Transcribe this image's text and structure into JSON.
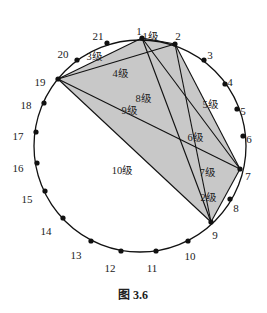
{
  "figure": {
    "caption": "图 3.6",
    "circle": {
      "cx": 140,
      "cy": 146,
      "r": 106
    },
    "shade_color": "#c8c8c8",
    "line_color": "#111111",
    "points": [
      {
        "id": "1",
        "x": 142,
        "y": 38,
        "lx": 139,
        "ly": 32
      },
      {
        "id": "2",
        "x": 175,
        "y": 44,
        "lx": 178,
        "ly": 37
      },
      {
        "id": "3",
        "x": 204,
        "y": 60,
        "lx": 210,
        "ly": 56
      },
      {
        "id": "4",
        "x": 225,
        "y": 84,
        "lx": 230,
        "ly": 83
      },
      {
        "id": "5",
        "x": 237,
        "y": 109,
        "lx": 243,
        "ly": 112
      },
      {
        "id": "6",
        "x": 243,
        "y": 136,
        "lx": 249,
        "ly": 140
      },
      {
        "id": "7",
        "x": 240,
        "y": 169,
        "lx": 248,
        "ly": 177
      },
      {
        "id": "8",
        "x": 230,
        "y": 199,
        "lx": 236,
        "ly": 209
      },
      {
        "id": "9",
        "x": 211,
        "y": 222,
        "lx": 215,
        "ly": 236
      },
      {
        "id": "10",
        "x": 188,
        "y": 241,
        "lx": 190,
        "ly": 257
      },
      {
        "id": "11",
        "x": 156,
        "y": 251,
        "lx": 152,
        "ly": 269
      },
      {
        "id": "12",
        "x": 121,
        "y": 251,
        "lx": 110,
        "ly": 269
      },
      {
        "id": "13",
        "x": 91,
        "y": 241,
        "lx": 76,
        "ly": 256
      },
      {
        "id": "14",
        "x": 63,
        "y": 218,
        "lx": 46,
        "ly": 232
      },
      {
        "id": "15",
        "x": 45,
        "y": 191,
        "lx": 27,
        "ly": 200
      },
      {
        "id": "16",
        "x": 37,
        "y": 163,
        "lx": 18,
        "ly": 169
      },
      {
        "id": "17",
        "x": 36,
        "y": 132,
        "lx": 18,
        "ly": 137
      },
      {
        "id": "18",
        "x": 44,
        "y": 103,
        "lx": 26,
        "ly": 106
      },
      {
        "id": "19",
        "x": 58,
        "y": 79,
        "lx": 40,
        "ly": 83
      },
      {
        "id": "20",
        "x": 77,
        "y": 60,
        "lx": 63,
        "ly": 55
      },
      {
        "id": "21",
        "x": 107,
        "y": 43,
        "lx": 98,
        "ly": 37
      }
    ],
    "edges": [
      [
        "19",
        "1"
      ],
      [
        "19",
        "2"
      ],
      [
        "19",
        "7"
      ],
      [
        "19",
        "9"
      ],
      [
        "1",
        "2"
      ],
      [
        "1",
        "7"
      ],
      [
        "1",
        "9"
      ],
      [
        "2",
        "7"
      ],
      [
        "2",
        "9"
      ],
      [
        "7",
        "9"
      ]
    ],
    "shaded_polygon": [
      "19",
      "1",
      "2",
      "7",
      "9"
    ],
    "level_labels": [
      {
        "text": "1级",
        "x": 150,
        "y": 38
      },
      {
        "text": "2级",
        "x": 208,
        "y": 199
      },
      {
        "text": "3级",
        "x": 94,
        "y": 58
      },
      {
        "text": "4级",
        "x": 120,
        "y": 75
      },
      {
        "text": "5级",
        "x": 210,
        "y": 106
      },
      {
        "text": "6级",
        "x": 195,
        "y": 139
      },
      {
        "text": "7级",
        "x": 207,
        "y": 174
      },
      {
        "text": "8级",
        "x": 143,
        "y": 100
      },
      {
        "text": "9级",
        "x": 129,
        "y": 112
      },
      {
        "text": "10级",
        "x": 122,
        "y": 172
      }
    ]
  }
}
